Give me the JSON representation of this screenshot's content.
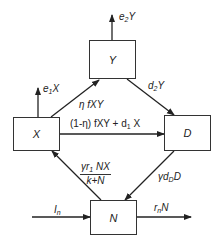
{
  "diagram": {
    "nodes": {
      "Y": {
        "label": "Y"
      },
      "X": {
        "label": "X"
      },
      "D": {
        "label": "D"
      },
      "N": {
        "label": "N"
      }
    },
    "edges": {
      "e2Y": {
        "from": "Y",
        "to": "out",
        "label_main": "e",
        "label_sub": "2",
        "label_tail": "Y"
      },
      "e1X": {
        "from": "X",
        "to": "out",
        "label_main": "e",
        "label_sub": "1",
        "label_tail": "X"
      },
      "X_to_Y": {
        "from": "X",
        "to": "Y",
        "label": "η fXY"
      },
      "Y_to_D": {
        "from": "Y",
        "to": "D",
        "label_main": "d",
        "label_sub": "2",
        "label_tail": "Y"
      },
      "X_to_D": {
        "from": "X",
        "to": "D",
        "label_pre": "(1-η) fXY + d",
        "label_sub": "1",
        "label_tail": " X"
      },
      "N_to_X": {
        "from": "N",
        "to": "X",
        "numerator_pre": "γr",
        "numerator_sub": "1",
        "numerator_tail": " NX",
        "denominator": "k+N"
      },
      "D_to_N": {
        "from": "D",
        "to": "N",
        "label_pre": "γd",
        "label_sub": "D",
        "label_tail": "D"
      },
      "In_to_N": {
        "from": "in",
        "to": "N",
        "label_main": "I",
        "label_sub": "n"
      },
      "N_out": {
        "from": "N",
        "to": "out",
        "label_main": "r",
        "label_sub": "n",
        "label_tail": "N"
      }
    }
  }
}
